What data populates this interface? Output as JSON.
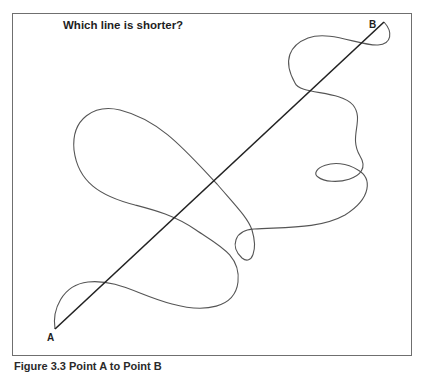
{
  "figure": {
    "title": "Which line is shorter?",
    "point_a_label": "A",
    "point_b_label": "B",
    "caption": "Figure 3.3 Point A to Point B"
  },
  "lines": {
    "straight": {
      "name": "straight-line",
      "from": "A",
      "to": "B",
      "color": "#222222"
    },
    "curvy": {
      "name": "curvy-line",
      "from": "A",
      "to": "B",
      "color": "#555555"
    }
  }
}
